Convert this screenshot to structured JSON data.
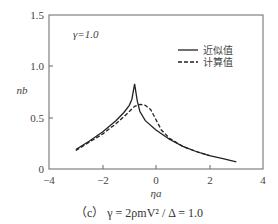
{
  "chart_data": {
    "type": "line",
    "title": "",
    "annotation": "γ=1.0",
    "xlabel": "η_a",
    "ylabel": "n_b",
    "xlim": [
      -4,
      4
    ],
    "ylim": [
      0,
      1.5
    ],
    "xticks": [
      "−4",
      "−2",
      "0",
      "2",
      "4"
    ],
    "yticks": [
      "0",
      "0.5",
      "1.0",
      "1.5"
    ],
    "grid": false,
    "legend_position": "upper right",
    "series": [
      {
        "name": "近似值",
        "style": "solid",
        "x": [
          -3.0,
          -2.5,
          -2.0,
          -1.5,
          -1.2,
          -1.0,
          -0.9,
          -0.8,
          -0.7,
          -0.6,
          -0.4,
          0.0,
          0.5,
          1.0,
          1.5,
          2.0,
          2.5,
          3.0
        ],
        "y": [
          0.19,
          0.27,
          0.36,
          0.47,
          0.55,
          0.62,
          0.68,
          0.83,
          0.66,
          0.56,
          0.47,
          0.38,
          0.29,
          0.22,
          0.17,
          0.13,
          0.1,
          0.07
        ]
      },
      {
        "name": "计算值",
        "style": "dashed",
        "x": [
          -3.0,
          -2.5,
          -2.0,
          -1.5,
          -1.2,
          -1.0,
          -0.8,
          -0.6,
          -0.4,
          -0.2,
          0.0,
          0.2,
          0.5,
          1.0,
          1.5,
          2.0
        ],
        "y": [
          0.18,
          0.26,
          0.34,
          0.44,
          0.51,
          0.56,
          0.61,
          0.63,
          0.62,
          0.58,
          0.48,
          0.38,
          0.3,
          0.22,
          0.17,
          0.13
        ]
      }
    ]
  },
  "annotation": "γ=1.0",
  "legend": {
    "solid": "近似值",
    "dashed": "计算值"
  },
  "axes": {
    "xlabel": "ηa",
    "ylabel": "nb",
    "xticks": [
      "−4",
      "−2",
      "0",
      "2",
      "4"
    ],
    "yticks": [
      "0",
      "0.5",
      "1.0",
      "1.5"
    ]
  },
  "caption": "（c） γ = 2ρmV² / Δ = 1.0"
}
